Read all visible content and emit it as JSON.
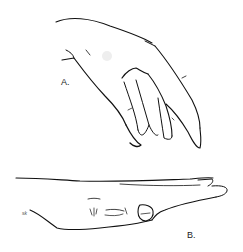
{
  "figure": {
    "panels": [
      {
        "id": "A",
        "label": "A.",
        "description": "hand viewed from above, fingers hanging down"
      },
      {
        "id": "B",
        "label": "B.",
        "description": "hand viewed from the side, flat"
      }
    ],
    "signature": "sk"
  }
}
